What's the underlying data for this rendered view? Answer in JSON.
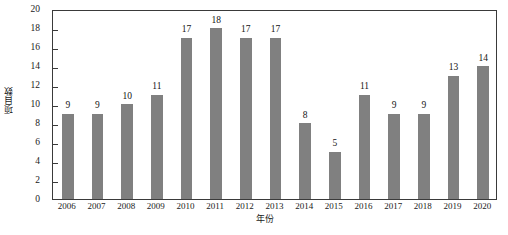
{
  "chart_data": {
    "type": "bar",
    "title": "",
    "subtitle": "",
    "xlabel": "年份",
    "ylabel": "项目数",
    "categories": [
      "2006",
      "2007",
      "2008",
      "2009",
      "2010",
      "2011",
      "2012",
      "2013",
      "2014",
      "2015",
      "2016",
      "2017",
      "2018",
      "2019",
      "2020"
    ],
    "values": [
      9,
      9,
      10,
      11,
      17,
      18,
      17,
      17,
      8,
      5,
      11,
      9,
      9,
      13,
      14
    ],
    "value_labels": [
      "9",
      "9",
      "10",
      "11",
      "17",
      "18",
      "17",
      "17",
      "8",
      "5",
      "11",
      "9",
      "9",
      "13",
      "14"
    ],
    "ylim": [
      0,
      20
    ],
    "ytick_values": [
      0,
      2,
      4,
      6,
      8,
      10,
      12,
      14,
      16,
      18,
      20
    ],
    "ytick_labels": [
      "0",
      "2",
      "4",
      "6",
      "8",
      "10",
      "12",
      "14",
      "16",
      "18",
      "20"
    ],
    "grid": false,
    "legend": null,
    "legend_position": "none",
    "bar_color": "#808080",
    "axis_color": "#3a3a3a",
    "text_color": "#1a1a1a",
    "background_color": "#ffffff",
    "annotations": "Data labels displayed above each bar"
  }
}
